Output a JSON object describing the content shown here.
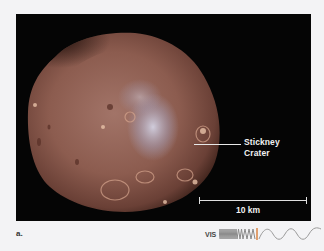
{
  "figure": {
    "letter": "a.",
    "annotation": {
      "line1": "Stickney",
      "line2": "Crater"
    },
    "scale_bar": {
      "label": "10 km"
    },
    "spectrum_indicator": {
      "label": "VIS",
      "icon": "wavelength-spectrum-icon",
      "highlight_color": "#e0a070"
    }
  },
  "colors": {
    "page_background": "#f3f3f5",
    "panel_background": "#050505",
    "moon_base": "#8a5a4c",
    "moon_highlight": "#c9c4d3",
    "annotation_text": "#f2f2f2"
  }
}
